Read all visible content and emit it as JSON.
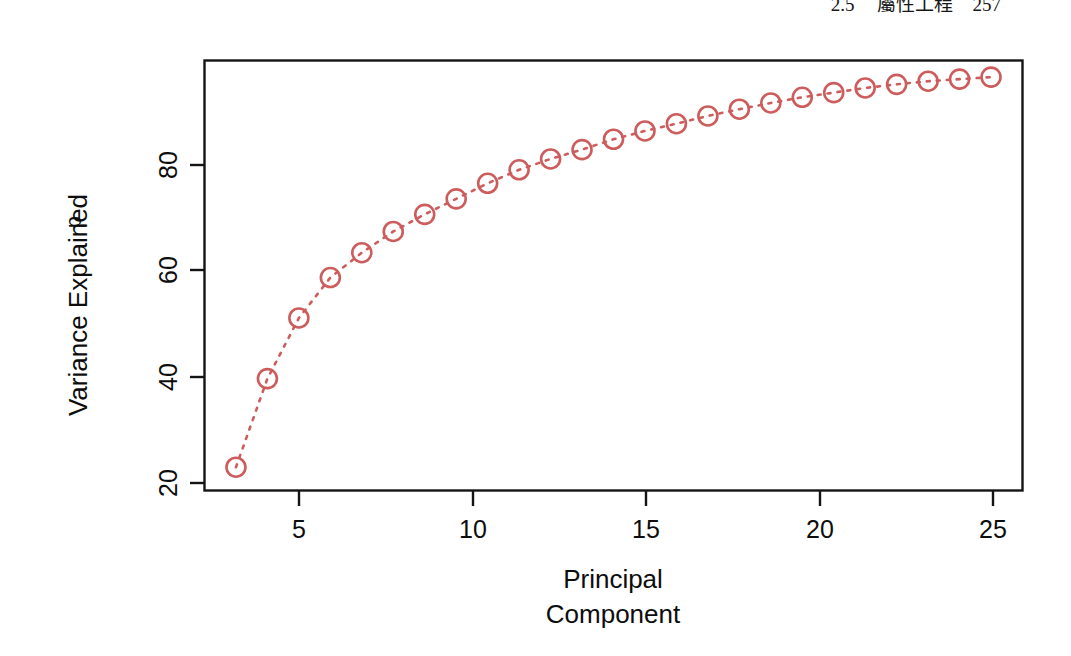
{
  "running_head": {
    "section": "2.5",
    "title_cjk": "屬性工程",
    "page_number": "257"
  },
  "figure": {
    "name": "cumulative-variance-explained-scree-plot",
    "marker_color": "#cd5c5c",
    "line_color": "#cd5c5c",
    "frame_color": "#141414",
    "background": "#ffffff"
  },
  "chart_data": {
    "type": "line",
    "title": "",
    "subtitle": "",
    "xlabel": "Principal Component",
    "xlabel_lines": [
      "Principal",
      "Component"
    ],
    "ylabel": "Variance Explained",
    "ylabel_extra": "p",
    "grid": false,
    "legend": "none",
    "marker": "open-circle",
    "linestyle": "dotted",
    "xlim": [
      0.0,
      26.0
    ],
    "ylim": [
      16.5,
      99.5
    ],
    "xticks": [
      5,
      10,
      15,
      20,
      25
    ],
    "xtick_labels": [
      "5",
      "10",
      "15",
      "20",
      "25"
    ],
    "yticks": [
      20,
      40,
      60,
      80
    ],
    "ytick_labels": [
      "20",
      "40",
      "60",
      "80"
    ],
    "x": [
      1,
      2,
      3,
      4,
      5,
      6,
      7,
      8,
      9,
      10,
      11,
      12,
      13,
      14,
      15,
      16,
      17,
      18,
      19,
      20,
      21,
      22,
      23,
      24,
      25
    ],
    "values": [
      21.0,
      38.1,
      49.8,
      57.6,
      62.4,
      66.5,
      69.8,
      72.8,
      75.8,
      78.4,
      80.5,
      82.3,
      84.3,
      85.9,
      87.3,
      88.8,
      90.1,
      91.3,
      92.4,
      93.3,
      94.2,
      94.9,
      95.5,
      95.9,
      96.3
    ],
    "series": [
      {
        "name": "Cumulative proportion of variance explained",
        "values": [
          21.0,
          38.1,
          49.8,
          57.6,
          62.4,
          66.5,
          69.8,
          72.8,
          75.8,
          78.4,
          80.5,
          82.3,
          84.3,
          85.9,
          87.3,
          88.8,
          90.1,
          91.3,
          92.4,
          93.3,
          94.2,
          94.9,
          95.5,
          95.9,
          96.3
        ]
      }
    ]
  }
}
